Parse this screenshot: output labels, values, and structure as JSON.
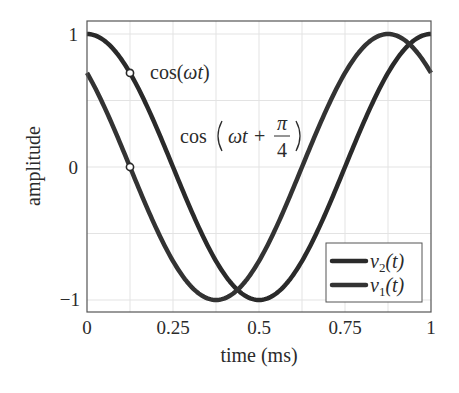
{
  "chart_data": {
    "type": "line",
    "title": "",
    "xlabel": "time (ms)",
    "ylabel": "amplitude",
    "xlim": [
      0,
      1
    ],
    "ylim": [
      -1.1,
      1.1
    ],
    "xticks": [
      0,
      0.25,
      0.5,
      0.75,
      1
    ],
    "xtick_labels": [
      "0",
      "0.25",
      "0.5",
      "0.75",
      "1"
    ],
    "yticks": [
      -1,
      0,
      1
    ],
    "ytick_labels": [
      "−1",
      "0",
      "1"
    ],
    "grid": true,
    "grid_x_step": 0.125,
    "grid_y_step": 0.5,
    "legend_position": "lower right",
    "series": [
      {
        "name": "v2(t)",
        "label_main": "v",
        "label_sub": "2",
        "label_arg": "(t)",
        "expression": "cos(ωt)",
        "omega_rad_per_ms": 6.283185,
        "phase": 0,
        "color": "#2a2a2a",
        "x": [
          0,
          0.125,
          0.25,
          0.375,
          0.5,
          0.625,
          0.75,
          0.875,
          1
        ],
        "values": [
          1,
          0.707,
          0,
          -0.707,
          -1,
          -0.707,
          0,
          0.707,
          1
        ]
      },
      {
        "name": "v1(t)",
        "label_main": "v",
        "label_sub": "1",
        "label_arg": "(t)",
        "expression": "cos(ωt + π/4)",
        "omega_rad_per_ms": 6.283185,
        "phase": 0.785398,
        "color": "#333333",
        "x": [
          0,
          0.125,
          0.25,
          0.375,
          0.5,
          0.625,
          0.75,
          0.875,
          1
        ],
        "values": [
          0.707,
          0,
          -0.707,
          -1,
          -0.707,
          0,
          0.707,
          1,
          0.707
        ]
      }
    ],
    "markers": [
      {
        "x": 0.125,
        "y": 0.707,
        "series": "v2(t)",
        "style": "open-circle"
      },
      {
        "x": 0.125,
        "y": 0,
        "series": "v1(t)",
        "style": "open-circle"
      }
    ],
    "annotations": [
      {
        "text": "cos(ωt)",
        "parts": [
          "cos(",
          "ωt",
          ")"
        ],
        "near_series": "v2(t)"
      },
      {
        "text": "cos(ωt + π/4)",
        "prefix": "cos",
        "body": "ωt +",
        "frac_num": "π",
        "frac_den": "4",
        "near_series": "v1(t)"
      }
    ]
  }
}
